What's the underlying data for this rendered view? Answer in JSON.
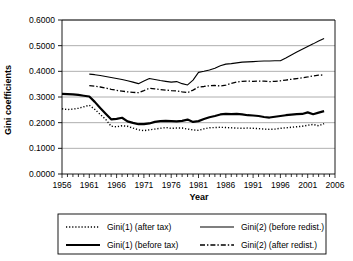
{
  "chart_data": {
    "type": "line",
    "title": "",
    "xlabel": "Year",
    "ylabel": "Gini coefficients",
    "xlim": [
      1956,
      2006
    ],
    "ylim": [
      0.0,
      0.6
    ],
    "ytick_labels": [
      "0.0000",
      "0.1000",
      "0.2000",
      "0.3000",
      "0.4000",
      "0.5000",
      "0.6000"
    ],
    "ytick_values": [
      0.0,
      0.1,
      0.2,
      0.3,
      0.4,
      0.5,
      0.6
    ],
    "xtick_labels": [
      "1956",
      "1961",
      "1966",
      "1971",
      "1976",
      "1981",
      "1986",
      "1991",
      "1996",
      "2001",
      "2006"
    ],
    "xtick_values": [
      1956,
      1961,
      1966,
      1971,
      1976,
      1981,
      1986,
      1991,
      1996,
      2001,
      2006
    ],
    "minor_xticks": "annual",
    "grid": "horizontal",
    "legend_position": "below",
    "series": [
      {
        "name": "Gini(1) (after tax)",
        "style": "dotted",
        "color": "#000000",
        "x": [
          1956,
          1957,
          1958,
          1959,
          1960,
          1961,
          1962,
          1963,
          1964,
          1965,
          1966,
          1967,
          1968,
          1969,
          1970,
          1971,
          1972,
          1973,
          1974,
          1975,
          1976,
          1977,
          1978,
          1979,
          1980,
          1981,
          1982,
          1983,
          1984,
          1985,
          1986,
          1987,
          1988,
          1989,
          1990,
          1991,
          1992,
          1993,
          1994,
          1995,
          1996,
          1997,
          1998,
          1999,
          2000,
          2001,
          2002,
          2003,
          2004
        ],
        "values": [
          0.254,
          0.251,
          0.253,
          0.256,
          0.262,
          0.268,
          0.252,
          0.232,
          0.213,
          0.186,
          0.184,
          0.188,
          0.186,
          0.179,
          0.172,
          0.169,
          0.172,
          0.175,
          0.178,
          0.181,
          0.178,
          0.179,
          0.179,
          0.175,
          0.172,
          0.17,
          0.176,
          0.18,
          0.181,
          0.182,
          0.181,
          0.18,
          0.179,
          0.178,
          0.179,
          0.178,
          0.177,
          0.175,
          0.174,
          0.175,
          0.178,
          0.18,
          0.182,
          0.184,
          0.186,
          0.19,
          0.193,
          0.188,
          0.196
        ]
      },
      {
        "name": "Gini(1) (before tax)",
        "style": "solid-thick",
        "color": "#000000",
        "x": [
          1956,
          1957,
          1958,
          1959,
          1960,
          1961,
          1962,
          1963,
          1964,
          1965,
          1966,
          1967,
          1968,
          1969,
          1970,
          1971,
          1972,
          1973,
          1974,
          1975,
          1976,
          1977,
          1978,
          1979,
          1980,
          1981,
          1982,
          1983,
          1984,
          1985,
          1986,
          1987,
          1988,
          1989,
          1990,
          1991,
          1992,
          1993,
          1994,
          1995,
          1996,
          1997,
          1998,
          1999,
          2000,
          2001,
          2002,
          2003,
          2004
        ],
        "values": [
          0.312,
          0.311,
          0.31,
          0.308,
          0.305,
          0.302,
          0.281,
          0.257,
          0.235,
          0.213,
          0.215,
          0.219,
          0.205,
          0.199,
          0.194,
          0.194,
          0.197,
          0.203,
          0.206,
          0.207,
          0.206,
          0.205,
          0.207,
          0.212,
          0.203,
          0.206,
          0.214,
          0.221,
          0.226,
          0.232,
          0.234,
          0.233,
          0.234,
          0.232,
          0.229,
          0.228,
          0.226,
          0.222,
          0.22,
          0.223,
          0.226,
          0.229,
          0.231,
          0.233,
          0.234,
          0.24,
          0.233,
          0.239,
          0.245
        ]
      },
      {
        "name": "Gini(2) (before redist.)",
        "style": "solid-thin",
        "color": "#000000",
        "x": [
          1961,
          1962,
          1963,
          1964,
          1965,
          1966,
          1967,
          1968,
          1969,
          1970,
          1971,
          1972,
          1973,
          1974,
          1975,
          1976,
          1977,
          1978,
          1979,
          1980,
          1981,
          1982,
          1983,
          1984,
          1985,
          1986,
          1987,
          1988,
          1989,
          1990,
          1991,
          1992,
          1993,
          1994,
          1995,
          1996,
          1997,
          1998,
          1999,
          2000,
          2001,
          2002,
          2003,
          2004
        ],
        "values": [
          0.389,
          0.387,
          0.384,
          0.38,
          0.376,
          0.372,
          0.368,
          0.363,
          0.358,
          0.352,
          0.362,
          0.372,
          0.368,
          0.364,
          0.361,
          0.358,
          0.36,
          0.352,
          0.347,
          0.366,
          0.396,
          0.4,
          0.405,
          0.412,
          0.422,
          0.428,
          0.43,
          0.433,
          0.436,
          0.437,
          0.438,
          0.439,
          0.44,
          0.44,
          0.441,
          0.441,
          0.452,
          0.464,
          0.475,
          0.486,
          0.497,
          0.507,
          0.518,
          0.528
        ]
      },
      {
        "name": "Gini(2) (after redist.)",
        "style": "dash-dot",
        "color": "#000000",
        "x": [
          1961,
          1962,
          1963,
          1964,
          1965,
          1966,
          1967,
          1968,
          1969,
          1970,
          1971,
          1972,
          1973,
          1974,
          1975,
          1976,
          1977,
          1978,
          1979,
          1980,
          1981,
          1982,
          1983,
          1984,
          1985,
          1986,
          1987,
          1988,
          1989,
          1990,
          1991,
          1992,
          1993,
          1994,
          1995,
          1996,
          1997,
          1998,
          1999,
          2000,
          2001,
          2002,
          2003,
          2004
        ],
        "values": [
          0.344,
          0.342,
          0.339,
          0.335,
          0.33,
          0.326,
          0.323,
          0.32,
          0.318,
          0.317,
          0.325,
          0.334,
          0.332,
          0.329,
          0.327,
          0.325,
          0.324,
          0.32,
          0.317,
          0.327,
          0.339,
          0.341,
          0.344,
          0.345,
          0.343,
          0.346,
          0.353,
          0.358,
          0.361,
          0.362,
          0.361,
          0.362,
          0.362,
          0.36,
          0.361,
          0.363,
          0.366,
          0.369,
          0.372,
          0.375,
          0.378,
          0.382,
          0.385,
          0.386
        ]
      }
    ]
  }
}
